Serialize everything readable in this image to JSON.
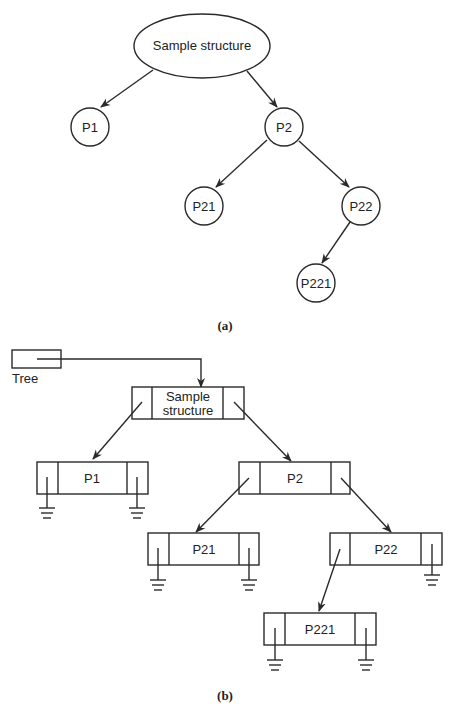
{
  "figure_a": {
    "caption": "(a)",
    "root": {
      "label": "Sample structure"
    },
    "nodes": [
      {
        "id": "P1",
        "label": "P1",
        "parent": "root"
      },
      {
        "id": "P2",
        "label": "P2",
        "parent": "root"
      },
      {
        "id": "P21",
        "label": "P21",
        "parent": "P2"
      },
      {
        "id": "P22",
        "label": "P22",
        "parent": "P2"
      },
      {
        "id": "P221",
        "label": "P221",
        "parent": "P22"
      }
    ]
  },
  "figure_b": {
    "caption": "(b)",
    "pointer": {
      "label": "Tree"
    },
    "root": {
      "label_line1": "Sample",
      "label_line2": "structure"
    },
    "nodes": [
      {
        "id": "P1",
        "label": "P1",
        "left": "null",
        "right": "null"
      },
      {
        "id": "P2",
        "label": "P2",
        "left": "P21",
        "right": "P22"
      },
      {
        "id": "P21",
        "label": "P21",
        "left": "null",
        "right": "null"
      },
      {
        "id": "P22",
        "label": "P22",
        "left": "P221",
        "right": "null"
      },
      {
        "id": "P221",
        "label": "P221",
        "left": "null",
        "right": "null"
      }
    ],
    "null_symbol": "ground-icon"
  }
}
